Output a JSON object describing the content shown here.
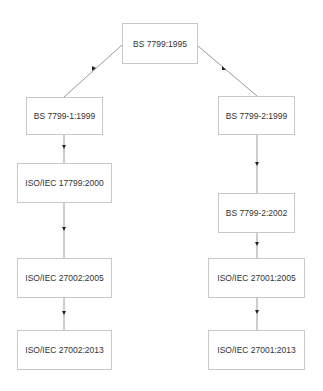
{
  "diagram": {
    "nodes": [
      {
        "id": "root",
        "label": "BS 7799:1995",
        "x": 122,
        "y": 23,
        "w": 76,
        "h": 41
      },
      {
        "id": "l1",
        "label": "BS 7799-1:1999",
        "x": 26,
        "y": 97,
        "w": 77,
        "h": 38
      },
      {
        "id": "l2",
        "label": "ISO/IEC 17799:2000",
        "x": 17,
        "y": 163,
        "w": 95,
        "h": 40
      },
      {
        "id": "l3",
        "label": "ISO/IEC 27002:2005",
        "x": 17,
        "y": 258,
        "w": 95,
        "h": 40
      },
      {
        "id": "l4",
        "label": "ISO/IEC 27002:2013",
        "x": 17,
        "y": 330,
        "w": 95,
        "h": 40
      },
      {
        "id": "r1",
        "label": "BS 7799-2:1999",
        "x": 218,
        "y": 96,
        "w": 77,
        "h": 39
      },
      {
        "id": "r2",
        "label": "BS 7799-2:2002",
        "x": 218,
        "y": 193,
        "w": 77,
        "h": 40
      },
      {
        "id": "r3",
        "label": "ISO/IEC 27001:2005",
        "x": 208,
        "y": 258,
        "w": 97,
        "h": 40
      },
      {
        "id": "r4",
        "label": "ISO/IEC 27001:2013",
        "x": 208,
        "y": 330,
        "w": 97,
        "h": 40
      }
    ],
    "edges": [
      {
        "from": "root",
        "to": "l1"
      },
      {
        "from": "root",
        "to": "r1"
      },
      {
        "from": "l1",
        "to": "l2"
      },
      {
        "from": "l2",
        "to": "l3"
      },
      {
        "from": "l3",
        "to": "l4"
      },
      {
        "from": "r1",
        "to": "r2"
      },
      {
        "from": "r2",
        "to": "r3"
      },
      {
        "from": "r3",
        "to": "r4"
      }
    ],
    "colors": {
      "line": "#9a9a9a",
      "border": "#c8c8c8",
      "text": "#333333"
    }
  }
}
